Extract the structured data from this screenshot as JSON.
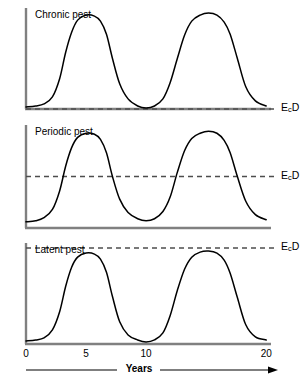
{
  "figure": {
    "xaxis_title": "Years",
    "xaxis_ticks": [
      {
        "label": "0",
        "value": 0
      },
      {
        "label": "5",
        "value": 5
      },
      {
        "label": "10",
        "value": 10
      },
      {
        "label": "20",
        "value": 20
      }
    ],
    "threshold_label_html": "E",
    "threshold_sub": "c",
    "threshold_tail": "D"
  },
  "panels": [
    {
      "title": "Chronic pest",
      "ylabel": "Population",
      "threshold_label": "EcD"
    },
    {
      "title": "Periodic pest",
      "ylabel": "Population",
      "threshold_label": "EcD"
    },
    {
      "title": "Latent pest",
      "ylabel": "Population",
      "threshold_label": "EcD"
    }
  ],
  "chart_data": {
    "type": "line",
    "title": "",
    "xlabel": "Years",
    "ylabel": "Population",
    "xlim": [
      0,
      20.4
    ],
    "grid": false,
    "legend": false,
    "x_ticks": [
      0,
      5,
      10,
      20
    ],
    "x_tick_labels": [
      "0",
      "5",
      "10",
      "20"
    ],
    "panels": [
      {
        "name": "Chronic pest",
        "ylabel": "Population",
        "annotation": "EcD",
        "threshold_value": 0.0,
        "threshold_note": "economic damage threshold lies at the population baseline; peaks far exceed it and troughs touch it",
        "ylim": [
          0,
          1
        ],
        "x": [
          0.0,
          0.8,
          1.5,
          2.2,
          2.8,
          3.3,
          3.8,
          4.3,
          5.0,
          5.7,
          6.2,
          6.7,
          7.2,
          7.8,
          8.5,
          9.3,
          10.0,
          10.7,
          11.4,
          12.0,
          12.6,
          13.2,
          13.8,
          14.5,
          15.2,
          15.9,
          16.5,
          17.0,
          17.6,
          18.3,
          19.1,
          20.0
        ],
        "y": [
          0.02,
          0.03,
          0.05,
          0.12,
          0.3,
          0.56,
          0.76,
          0.88,
          0.93,
          0.92,
          0.87,
          0.74,
          0.5,
          0.25,
          0.1,
          0.03,
          0.01,
          0.03,
          0.1,
          0.26,
          0.5,
          0.73,
          0.87,
          0.93,
          0.95,
          0.93,
          0.86,
          0.74,
          0.5,
          0.22,
          0.08,
          0.03
        ]
      },
      {
        "name": "Periodic pest",
        "ylabel": "Population",
        "annotation": "EcD",
        "threshold_value": 0.5,
        "threshold_note": "economic damage threshold at mid population; peaks rise above it, troughs fall below it",
        "ylim": [
          0,
          1
        ],
        "x": [
          0.0,
          0.8,
          1.5,
          2.2,
          2.8,
          3.3,
          3.8,
          4.3,
          5.0,
          5.7,
          6.2,
          6.7,
          7.2,
          7.8,
          8.5,
          9.3,
          10.0,
          10.7,
          11.4,
          12.0,
          12.6,
          13.2,
          13.8,
          14.5,
          15.2,
          15.9,
          16.5,
          17.0,
          17.6,
          18.3,
          19.1,
          20.0
        ],
        "y": [
          0.06,
          0.07,
          0.1,
          0.18,
          0.36,
          0.6,
          0.78,
          0.88,
          0.92,
          0.91,
          0.86,
          0.73,
          0.5,
          0.28,
          0.15,
          0.09,
          0.07,
          0.09,
          0.16,
          0.3,
          0.54,
          0.75,
          0.87,
          0.92,
          0.94,
          0.92,
          0.85,
          0.73,
          0.5,
          0.26,
          0.13,
          0.08
        ]
      },
      {
        "name": "Latent pest",
        "ylabel": "Population",
        "annotation": "EcD",
        "threshold_value": 0.95,
        "threshold_note": "economic damage threshold above all peaks; population never reaches damaging levels",
        "ylim": [
          0,
          1
        ],
        "x": [
          0.0,
          0.8,
          1.5,
          2.2,
          2.8,
          3.3,
          3.8,
          4.3,
          5.0,
          5.7,
          6.2,
          6.7,
          7.2,
          7.8,
          8.5,
          9.3,
          10.0,
          10.7,
          11.4,
          12.0,
          12.6,
          13.2,
          13.8,
          14.5,
          15.2,
          15.9,
          16.5,
          17.0,
          17.6,
          18.3,
          19.1,
          20.0
        ],
        "y": [
          0.03,
          0.04,
          0.06,
          0.14,
          0.32,
          0.57,
          0.76,
          0.86,
          0.9,
          0.89,
          0.84,
          0.71,
          0.47,
          0.22,
          0.09,
          0.04,
          0.02,
          0.04,
          0.11,
          0.28,
          0.53,
          0.74,
          0.86,
          0.91,
          0.92,
          0.9,
          0.83,
          0.7,
          0.46,
          0.19,
          0.07,
          0.04
        ]
      }
    ]
  }
}
